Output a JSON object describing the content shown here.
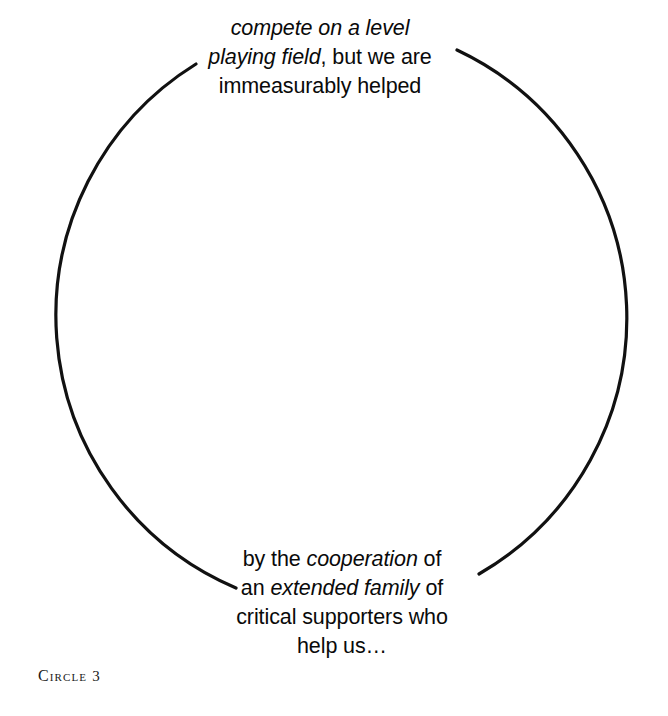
{
  "figure": {
    "caption_label": "Circle",
    "caption_number": "3",
    "caption_full": "CIRCLE 3",
    "shape": "circle",
    "stroke_color": "#000000",
    "background_color": "#ffffff",
    "text_color": "#0a0a0a"
  },
  "top_text": {
    "line1": {
      "italic_1": "compete on a level"
    },
    "line2": {
      "italic_1": "playing field",
      "roman_1": ", but we are"
    },
    "line3": {
      "roman_1": "immeasurably helped"
    },
    "plain": "compete on a level playing field, but we are immeasurably helped"
  },
  "bottom_text": {
    "line1": {
      "roman_1": "by the ",
      "italic_1": "cooperation",
      "roman_2": " of"
    },
    "line2": {
      "roman_1": "an ",
      "italic_1": "extended family",
      "roman_2": " of"
    },
    "line3": {
      "roman_1": "critical supporters who"
    },
    "line4": {
      "roman_1": "help us…"
    },
    "plain": "by the cooperation of an extended family of critical supporters who help us…"
  },
  "geometry": {
    "center_x": 344,
    "center_y": 327,
    "radius": 296,
    "stroke_width": 3
  }
}
